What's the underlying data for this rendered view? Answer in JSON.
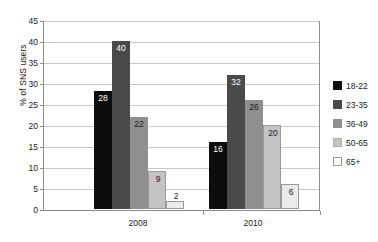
{
  "chart_data": {
    "type": "bar",
    "title": "",
    "xlabel": "",
    "ylabel": "% of SNS users",
    "ylim": [
      0,
      45
    ],
    "ytick_step": 5,
    "yticks": [
      0,
      5,
      10,
      15,
      20,
      25,
      30,
      35,
      40,
      45
    ],
    "grid": true,
    "legend_position": "right",
    "categories": [
      "2008",
      "2010"
    ],
    "series": [
      {
        "name": "18-22",
        "color": "#0d0d0d",
        "values": [
          28,
          16
        ]
      },
      {
        "name": "23-35",
        "color": "#4a4a4a",
        "values": [
          40,
          32
        ]
      },
      {
        "name": "36-49",
        "color": "#8f8f8f",
        "values": [
          22,
          26
        ]
      },
      {
        "name": "50-65",
        "color": "#c4c4c4",
        "values": [
          9,
          20
        ]
      },
      {
        "name": "65+",
        "color": "#ebebeb",
        "values": [
          2,
          6
        ]
      }
    ],
    "data_labels": {
      "2008": [
        "28",
        "40",
        "22",
        "9",
        "2"
      ],
      "2010": [
        "16",
        "32",
        "26",
        "20",
        "6"
      ]
    }
  },
  "axis": {
    "y_title": "% of SNS users",
    "y_tick_labels": [
      "45",
      "40",
      "35",
      "30",
      "25",
      "20",
      "15",
      "10",
      "5",
      "0"
    ],
    "x_tick_labels": [
      "2008",
      "2010"
    ]
  },
  "legend": {
    "entries": [
      {
        "label": "18-22",
        "color": "#0d0d0d",
        "border": "#0d0d0d"
      },
      {
        "label": "23-35",
        "color": "#4a4a4a",
        "border": "#4a4a4a"
      },
      {
        "label": "36-49",
        "color": "#8f8f8f",
        "border": "#8f8f8f"
      },
      {
        "label": "50-65",
        "color": "#c4c4c4",
        "border": "#b0b0b0"
      },
      {
        "label": "65+",
        "color": "#ffffff",
        "border": "#9a9a9a"
      }
    ]
  }
}
